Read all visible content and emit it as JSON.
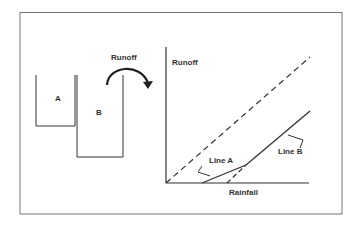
{
  "diagram": {
    "containers": {
      "a_label": "A",
      "b_label": "B"
    },
    "overflow_label": "Runoff",
    "graph": {
      "y_axis_label": "Runoff",
      "x_axis_label": "Rainfall",
      "line_a_label": "Line A",
      "line_b_label": "Line B"
    },
    "colors": {
      "stroke": "#333333",
      "frame": "#777777",
      "background": "#ffffff"
    }
  }
}
